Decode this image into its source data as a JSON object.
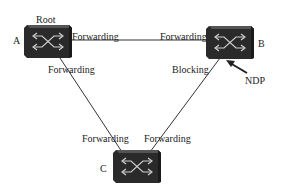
{
  "diagram": {
    "type": "network-topology",
    "nodes": [
      {
        "id": "A",
        "label": "A",
        "role_label": "Root",
        "icon": "switch-icon"
      },
      {
        "id": "B",
        "label": "B",
        "icon": "switch-icon"
      },
      {
        "id": "C",
        "label": "C",
        "icon": "switch-icon"
      }
    ],
    "links": [
      {
        "from": "A",
        "to": "B",
        "from_port_state": "Forwarding",
        "to_port_state": "Forwarding"
      },
      {
        "from": "A",
        "to": "C",
        "from_port_state": "Forwarding",
        "to_port_state": "Forwarding"
      },
      {
        "from": "B",
        "to": "C",
        "from_port_state": "Blocking",
        "to_port_state": "Forwarding"
      }
    ],
    "annotation": {
      "text": "NDP",
      "points_to": "B-blocking-port"
    },
    "colors": {
      "switch_body": "#2a2a2a",
      "switch_top": "#4a4a4a",
      "line": "#333333",
      "background": "#ffffff"
    }
  }
}
